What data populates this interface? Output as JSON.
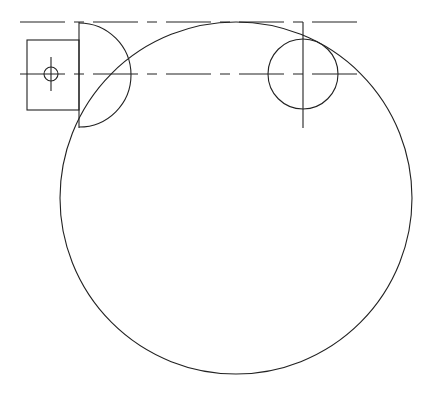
{
  "drawing": {
    "type": "technical-line-drawing",
    "stroke_color": "#222222",
    "background": "#ffffff",
    "centerline_dash": "45 9 10 9",
    "centerlines": [
      {
        "name": "top-centerline",
        "x1": 20,
        "y1": 22,
        "x2": 366,
        "y2": 22
      },
      {
        "name": "mid-centerline",
        "x1": 20,
        "y1": 74,
        "x2": 366,
        "y2": 74
      }
    ],
    "vertical_lines": [
      {
        "name": "left-vertical-axis",
        "x": 79,
        "y1": 22,
        "y2": 128
      },
      {
        "name": "right-vertical-axis",
        "x": 303,
        "y1": 22,
        "y2": 128
      },
      {
        "name": "small-hole-vertical-axis",
        "x": 51,
        "y1": 57,
        "y2": 91
      }
    ],
    "rectangle": {
      "name": "left-block",
      "x": 27,
      "y": 40,
      "width": 52,
      "height": 70
    },
    "circles": [
      {
        "name": "large-circle",
        "cx": 236,
        "cy": 198,
        "r": 176
      },
      {
        "name": "small-right-circle",
        "cx": 303,
        "cy": 74,
        "r": 35
      },
      {
        "name": "small-hole-circle",
        "cx": 51,
        "cy": 74,
        "r": 7
      }
    ],
    "half_circle": {
      "name": "left-half-circle",
      "cx": 79,
      "cy": 75,
      "r": 52
    }
  }
}
